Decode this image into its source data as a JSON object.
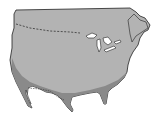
{
  "map": {
    "description": "Outline map of the contiguous United States and southern Canada with a darker shaded band along the southern and southwestern regions",
    "colors": {
      "background": "#ffffff",
      "land": "#b3b3b3",
      "shaded_region": "#8a8a8a",
      "outline": "#222222",
      "water": "#ffffff",
      "border_line": "#333333"
    },
    "features": [
      "us-canada-border-dashed",
      "great-lakes",
      "shaded-southern-band",
      "florida",
      "baja-california"
    ]
  }
}
